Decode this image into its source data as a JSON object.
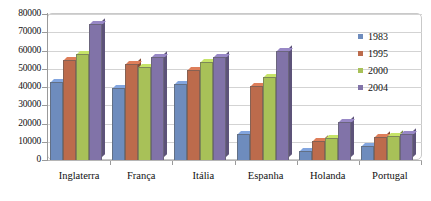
{
  "chart_data": {
    "type": "bar",
    "title": "",
    "subtitle": "",
    "xlabel": "",
    "ylabel": "",
    "categories": [
      "Inglaterra",
      "França",
      "Itália",
      "Espanha",
      "Holanda",
      "Portugal"
    ],
    "series": [
      {
        "name": "1983",
        "color": "#6E8CBD",
        "values": [
          43000,
          39500,
          41500,
          14500,
          5000,
          7500
        ]
      },
      {
        "name": "1995",
        "color": "#BC6B4C",
        "values": [
          55000,
          52500,
          49500,
          40500,
          10500,
          12500
        ]
      },
      {
        "name": "2000",
        "color": "#A8C158",
        "values": [
          58000,
          51000,
          53500,
          45500,
          12000,
          13000
        ]
      },
      {
        "name": "2004",
        "color": "#8173A8",
        "values": [
          74500,
          56500,
          56500,
          59500,
          21000,
          14000
        ]
      }
    ],
    "ylim": [
      0,
      80000
    ],
    "y_ticks": [
      0,
      10000,
      20000,
      30000,
      40000,
      50000,
      60000,
      70000,
      80000
    ],
    "y_tick_labels": [
      "0",
      "10000",
      "20000",
      "30000",
      "40000",
      "50000",
      "60000",
      "70000",
      "80000"
    ],
    "grid": true,
    "legend_position": "right",
    "legend_entries": [
      "1983",
      "1995",
      "2000",
      "2004"
    ]
  }
}
